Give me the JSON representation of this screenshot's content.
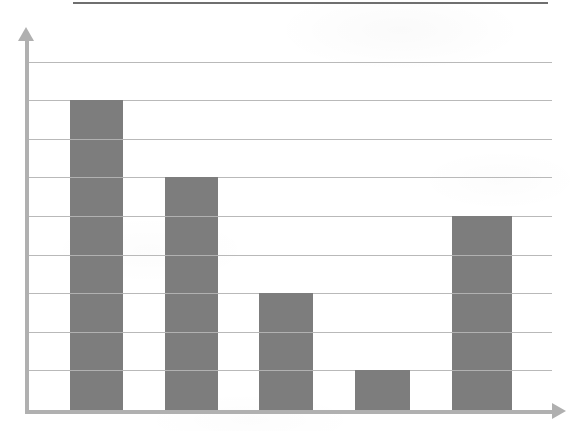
{
  "figure": {
    "background_color": "#ffffff",
    "top_rule": {
      "name": "top-horizontal-rule",
      "color": "#6f6f6f",
      "x": 73,
      "y": 2,
      "width": 475,
      "height": 2
    }
  },
  "chart_data": {
    "type": "bar",
    "title": "",
    "subtitle": "",
    "xlabel": "",
    "ylabel": "",
    "categories": [
      "1",
      "2",
      "3",
      "4",
      "5"
    ],
    "values": [
      8,
      6,
      3,
      1,
      5
    ],
    "ylim": [
      0,
      9
    ],
    "xlim": [
      0,
      5
    ],
    "grid": true,
    "grid_axis": "y",
    "grid_line_count": 9,
    "grid_tick_values": [
      1,
      2,
      3,
      4,
      5,
      6,
      7,
      8,
      9
    ],
    "legend": null,
    "legend_position": "none",
    "tick_labels_x": [],
    "tick_labels_y": [],
    "annotations": [],
    "series": [
      {
        "name": "series-1",
        "color": "#7d7d7d",
        "values": [
          8,
          6,
          3,
          1,
          5
        ]
      }
    ],
    "colors": {
      "bar_fill": "#7d7d7d",
      "gridline": "#b9b9b9",
      "axis": "#b0b0b0",
      "top_rule": "#6f6f6f",
      "background": "#ffffff"
    },
    "geometry": {
      "plot_left": 25,
      "plot_right": 552,
      "plot_top": 62,
      "plot_bottom": 410,
      "gridline_y": [
        62,
        100,
        139,
        177,
        216,
        255,
        293,
        332,
        370
      ],
      "bars": [
        {
          "name": "bar-1",
          "x": 70,
          "y": 100,
          "width": 53,
          "height": 310,
          "value": 8
        },
        {
          "name": "bar-2",
          "x": 165,
          "y": 177,
          "width": 53,
          "height": 233,
          "value": 6
        },
        {
          "name": "bar-3",
          "x": 259,
          "y": 293,
          "width": 54,
          "height": 117,
          "value": 3
        },
        {
          "name": "bar-4",
          "x": 355,
          "y": 370,
          "width": 55,
          "height": 40,
          "value": 1
        },
        {
          "name": "bar-5",
          "x": 452,
          "y": 216,
          "width": 60,
          "height": 194,
          "value": 5
        }
      ],
      "y_axis": {
        "x": 25,
        "top": 40,
        "bottom": 411,
        "thickness": 4
      },
      "x_axis": {
        "y": 410,
        "left": 25,
        "right": 554,
        "thickness": 4
      },
      "y_axis_arrow": {
        "x": 18,
        "y": 27
      },
      "x_axis_arrow": {
        "x": 552,
        "y": 403
      }
    }
  }
}
